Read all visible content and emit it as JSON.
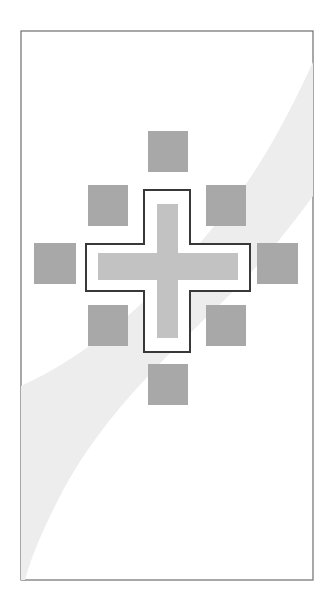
{
  "figure": {
    "canvas": {
      "width": 335,
      "height": 610,
      "background": "#ffffff"
    },
    "frame": {
      "name": "outer-frame",
      "x": 21,
      "y": 31,
      "width": 292,
      "height": 549,
      "stroke": "#6e6e6e",
      "stroke_width": 1.2,
      "fill": "#ffffff"
    },
    "background_band": {
      "name": "diagonal-swoosh",
      "fill": "#ededed",
      "description": "light grey curved band sweeping from lower-left to upper-right corner",
      "path": "M 21 580 L 21 386 C 96 352 170 286 236 198 C 266 158 292 108 313 62 L 313 196 C 284 236 252 274 216 308 C 160 362 96 424 58 500 C 44 528 32 554 25 580 Z"
    },
    "center": {
      "x": 167,
      "y": 264
    },
    "tiles": {
      "fill": "#a8a8a8",
      "items": [
        {
          "name": "tile-top-center",
          "label": "N",
          "x": 148,
          "y": 131,
          "width": 40,
          "height": 41
        },
        {
          "name": "tile-top-left",
          "label": "NW",
          "x": 88,
          "y": 185,
          "width": 40,
          "height": 41
        },
        {
          "name": "tile-top-right",
          "label": "NE",
          "x": 206,
          "y": 185,
          "width": 40,
          "height": 41
        },
        {
          "name": "tile-middle-left",
          "label": "W",
          "x": 34,
          "y": 243,
          "width": 42,
          "height": 41
        },
        {
          "name": "tile-middle-right",
          "label": "E",
          "x": 257,
          "y": 243,
          "width": 41,
          "height": 41
        },
        {
          "name": "tile-bottom-left",
          "label": "SW",
          "x": 88,
          "y": 305,
          "width": 40,
          "height": 41
        },
        {
          "name": "tile-bottom-right",
          "label": "SE",
          "x": 206,
          "y": 305,
          "width": 40,
          "height": 41
        },
        {
          "name": "tile-bottom-center",
          "label": "S",
          "x": 148,
          "y": 364,
          "width": 40,
          "height": 41
        }
      ]
    },
    "outlined_cross": {
      "name": "cross-outline",
      "stroke": "#383838",
      "stroke_width": 2,
      "fill": "#ffffff",
      "path": "M 144 190 L 190 190 L 190 244 L 250 244 L 250 291 L 190 291 L 190 352 L 144 352 L 144 291 L 86 291 L 86 244 L 144 244 Z"
    },
    "inner_cross": {
      "name": "cross-fill",
      "fill": "#c2c2c2",
      "path": "M 157 204 L 178 204 L 178 253 L 238 253 L 238 280 L 178 280 L 178 338 L 157 338 L 157 280 L 98 280 L 98 253 L 157 253 Z"
    }
  }
}
